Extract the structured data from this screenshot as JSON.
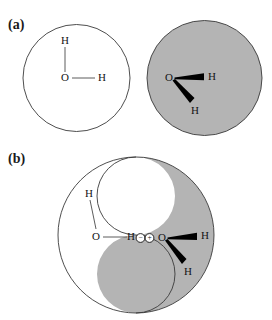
{
  "figure": {
    "title_visible": false,
    "background_color": "#ffffff",
    "outline_color": "#3a3a3a",
    "shaded_fill_color": "#b4b4b4",
    "unshaded_fill_color": "#ffffff",
    "bond_thin_color": "#4a4a4a",
    "bond_thick_color": "#000000",
    "text_color": "#141414"
  },
  "panels": [
    {
      "label": "(a)",
      "description_visible": false,
      "shapes": [
        {
          "name": "unshaded-circle",
          "fill": "#ffffff",
          "molecule": {
            "oxygen_label": "O",
            "hydrogen_labels": [
              "H",
              "H"
            ],
            "bond_style": "thin-line"
          }
        },
        {
          "name": "shaded-circle",
          "fill": "#b4b4b4",
          "molecule": {
            "oxygen_label": "O",
            "hydrogen_labels": [
              "H",
              "H"
            ],
            "bond_style": "thick-wedge"
          }
        }
      ]
    },
    {
      "label": "(b)",
      "description_visible": false,
      "shapes": [
        {
          "name": "taijitu-interlocked-circle",
          "unshaded_lobe_fill": "#ffffff",
          "shaded_lobe_fill": "#b4b4b4",
          "molecules": [
            {
              "name": "unshaded-molecule",
              "oxygen_label": "O",
              "hydrogen_labels": [
                "H",
                "H"
              ],
              "bond_style": "thin-line"
            },
            {
              "name": "shaded-molecule",
              "oxygen_label": "O",
              "hydrogen_labels": [
                "H",
                "H"
              ],
              "bond_style": "thick-wedge"
            }
          ],
          "charges": [
            {
              "name": "negative-charge",
              "symbol": "−"
            },
            {
              "name": "positive-charge",
              "symbol": "+"
            }
          ]
        }
      ]
    }
  ],
  "atoms": {
    "oxygen": "O",
    "hydrogen": "H"
  },
  "charges": {
    "negative": "−",
    "positive": "+"
  }
}
